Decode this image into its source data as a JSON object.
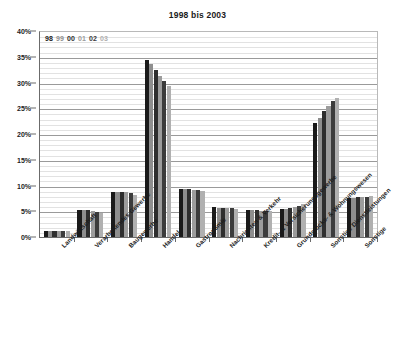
{
  "chart": {
    "title": "1998 bis 2003",
    "ylabel": "",
    "xlabel": ""
  },
  "legend": {
    "position": "top-left-inside",
    "entries": [
      {
        "label": "98",
        "color": "#1a1a1a"
      },
      {
        "label": "99",
        "color": "#8e8e8e"
      },
      {
        "label": "00",
        "color": "#2e2e2e"
      },
      {
        "label": "01",
        "color": "#9c9c9c"
      },
      {
        "label": "02",
        "color": "#3c3c3c"
      },
      {
        "label": "03",
        "color": "#b0b0b0"
      }
    ]
  },
  "y_axis": {
    "ticks": [
      "0%",
      "5%",
      "10%",
      "15%",
      "20%",
      "25%",
      "30%",
      "35%",
      "40%"
    ],
    "min": 0,
    "max": 40,
    "step": 5
  },
  "x_axis": {
    "categories": [
      "Landwirtschaft",
      "Verarbeitendes Gewerbe",
      "Baugewerbe",
      "Handel",
      "Gastronomie",
      "Nachrichten & Verkehr",
      "Kredit- & Versicherungsgewerbe",
      "Grundstücks- & Wohnungswesen",
      "Sonstige Dienstleistungen",
      "Sonstige"
    ]
  },
  "chart_data": {
    "type": "bar",
    "title": "1998 bis 2003",
    "xlabel": "",
    "ylabel": "",
    "ylim": [
      0,
      40
    ],
    "grid": true,
    "legend_position": "top-left-inside",
    "categories": [
      "Landwirtschaft",
      "Verarbeitendes Gewerbe",
      "Baugewerbe",
      "Handel",
      "Gastronomie",
      "Nachrichten & Verkehr",
      "Kredit- & Versicherungsgewerbe",
      "Grundstücks- & Wohnungswesen",
      "Sonstige Dienstleistungen",
      "Sonstige"
    ],
    "series": [
      {
        "name": "98",
        "color": "#1a1a1a",
        "values": [
          1.2,
          5.2,
          8.8,
          34.3,
          9.4,
          5.8,
          5.2,
          5.4,
          22.2,
          7.6
        ]
      },
      {
        "name": "99",
        "color": "#8e8e8e",
        "values": [
          1.2,
          5.2,
          8.7,
          33.6,
          9.4,
          5.7,
          5.2,
          5.5,
          23.2,
          7.6
        ]
      },
      {
        "name": "00",
        "color": "#2e2e2e",
        "values": [
          1.2,
          5.2,
          8.8,
          32.4,
          9.3,
          5.7,
          5.2,
          5.6,
          24.4,
          7.7
        ]
      },
      {
        "name": "01",
        "color": "#9c9c9c",
        "values": [
          1.2,
          5.0,
          8.7,
          31.2,
          9.2,
          5.6,
          5.1,
          5.8,
          25.4,
          7.7
        ]
      },
      {
        "name": "02",
        "color": "#3c3c3c",
        "values": [
          1.2,
          4.8,
          8.5,
          30.2,
          9.1,
          5.6,
          5.1,
          6.1,
          26.4,
          7.8
        ]
      },
      {
        "name": "03",
        "color": "#b0b0b0",
        "values": [
          1.2,
          4.7,
          8.1,
          29.3,
          8.9,
          5.5,
          5.1,
          6.5,
          26.9,
          7.9
        ]
      }
    ]
  }
}
